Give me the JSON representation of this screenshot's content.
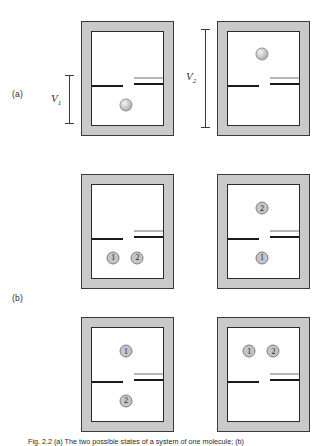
{
  "figure": {
    "caption": "Fig. 2.2 (a) The two possible states of a system of one molecule; (b)",
    "rows": [
      {
        "label": "(a)",
        "panels": [
          {
            "name": "panel-a-left",
            "volume_label": "V",
            "volume_subscript": "1",
            "molecules": [
              {
                "kind": "sphere",
                "label": "",
                "chamber": "lower"
              }
            ]
          },
          {
            "name": "panel-a-right",
            "volume_label": "V",
            "volume_subscript": "2",
            "molecules": [
              {
                "kind": "sphere",
                "label": "",
                "chamber": "upper"
              }
            ]
          }
        ]
      },
      {
        "label": "(b)",
        "panels": [
          {
            "name": "panel-b-left",
            "volume_label": "",
            "volume_subscript": "",
            "molecules": [
              {
                "kind": "tag",
                "label": "1",
                "chamber": "lower"
              },
              {
                "kind": "tag",
                "label": "2",
                "chamber": "lower"
              }
            ]
          },
          {
            "name": "panel-b-right",
            "volume_label": "",
            "volume_subscript": "",
            "molecules": [
              {
                "kind": "tag",
                "label": "2",
                "chamber": "upper"
              },
              {
                "kind": "tag",
                "label": "1",
                "chamber": "lower"
              }
            ]
          },
          {
            "name": "panel-c-left",
            "volume_label": "",
            "volume_subscript": "",
            "molecules": [
              {
                "kind": "tag",
                "label": "1",
                "chamber": "upper"
              },
              {
                "kind": "tag",
                "label": "2",
                "chamber": "lower"
              }
            ]
          },
          {
            "name": "panel-c-right",
            "volume_label": "",
            "volume_subscript": "",
            "molecules": [
              {
                "kind": "tag",
                "label": "1",
                "chamber": "upper"
              },
              {
                "kind": "tag",
                "label": "2",
                "chamber": "upper"
              }
            ]
          }
        ]
      }
    ],
    "colors": {
      "wall": "#c9c9c9",
      "wall_outline": "#3a3a3a",
      "interior": "#ffffff",
      "partition": "#1a1a1a",
      "valve": "#b5b5b5",
      "molecule": "#c4c4c4",
      "text": "#2b2b2b"
    }
  }
}
